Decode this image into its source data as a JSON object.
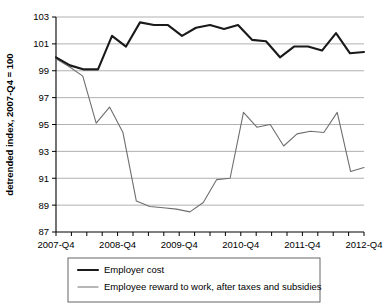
{
  "chart_data": {
    "type": "line",
    "title": "",
    "xlabel": "",
    "ylabel": "detrended index, 2007-Q4 = 100",
    "ylim": [
      87,
      103
    ],
    "ytick_step": 2,
    "yticks": [
      87,
      89,
      91,
      93,
      95,
      97,
      99,
      101,
      103
    ],
    "grid": "horizontal",
    "legend_position": "bottom",
    "x": [
      "2007-Q4",
      "2008-Q1",
      "2008-Q2",
      "2008-Q3",
      "2008-Q4",
      "2009-Q1",
      "2009-Q2",
      "2009-Q3",
      "2009-Q4",
      "2010-Q1",
      "2010-Q2",
      "2010-Q3",
      "2010-Q4",
      "2011-Q1",
      "2011-Q2",
      "2011-Q3",
      "2011-Q4",
      "2012-Q1",
      "2012-Q2",
      "2012-Q3",
      "2012-Q4"
    ],
    "xtick_labels": [
      "2007-Q4",
      "2008-Q4",
      "2009-Q4",
      "2010-Q4",
      "2011-Q4",
      "2012-Q4"
    ],
    "xtick_label_indices": [
      0,
      4,
      8,
      12,
      16,
      20
    ],
    "series": [
      {
        "name": "Employer cost",
        "color": "#1a1a1a",
        "width": 2.1,
        "values": [
          100.0,
          99.4,
          99.1,
          99.1,
          101.6,
          100.8,
          102.6,
          102.4,
          102.4,
          101.6,
          102.2,
          102.4,
          102.1,
          102.4,
          101.3,
          101.2,
          100.0,
          100.8,
          100.8,
          100.5,
          101.8
        ],
        "values_tail": [
          100.3,
          100.4
        ]
      },
      {
        "name": "Employee reward to work, after taxes and subsidies",
        "color": "#6e6e6e",
        "width": 1.1,
        "values": [
          99.9,
          99.3,
          98.6,
          95.1,
          96.3,
          94.4,
          89.3,
          88.9,
          88.8,
          88.7,
          88.5,
          89.2,
          90.9,
          91.0,
          95.9,
          94.8,
          95.0,
          93.4,
          94.3,
          94.5,
          94.4
        ],
        "values_tail": [
          95.9,
          91.5,
          91.8
        ]
      }
    ],
    "legend": [
      {
        "label": "Employer cost",
        "swatch": "thick-black-line"
      },
      {
        "label": "Employee reward to work, after taxes and subsidies",
        "swatch": "thin-gray-line"
      }
    ],
    "colors": {
      "employer": "#1a1a1a",
      "employee": "#6e6e6e",
      "grid": "#a8a8a8",
      "axis": "#000000",
      "background": "#ffffff"
    }
  }
}
